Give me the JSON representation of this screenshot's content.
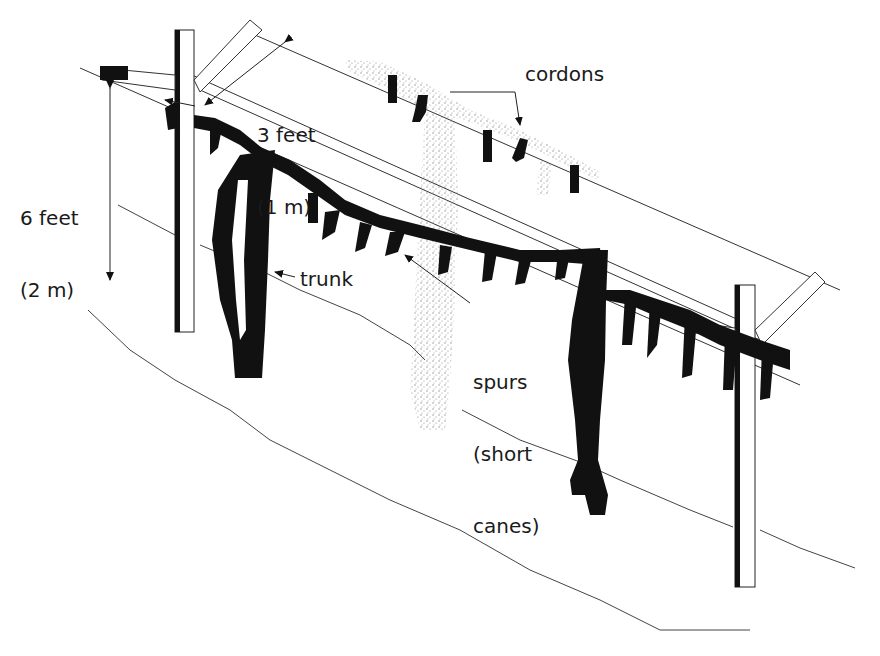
{
  "diagram": {
    "type": "illustration",
    "colors": {
      "ink": "#111111",
      "line": "#333333",
      "stipple": "#9a9a9a",
      "background": "#ffffff"
    },
    "labels": {
      "height_line1": "6 feet",
      "height_line2": "(2 m)",
      "width_line1": "3 feet",
      "width_line2": "(1 m)",
      "cordons": "cordons",
      "trunk": "trunk",
      "spurs_line1": "spurs",
      "spurs_line2": "(short",
      "spurs_line3": "canes)"
    },
    "dimensions": [
      {
        "name": "trellis-height",
        "value": "6 feet",
        "metric": "2 m"
      },
      {
        "name": "cross-arm-width",
        "value": "3 feet",
        "metric": "1 m"
      }
    ],
    "components": [
      "post-left",
      "post-right",
      "cross-arm-left",
      "cross-arm-right",
      "upper-wire",
      "lower-wire",
      "cordon-front",
      "cordon-back",
      "trunk-front",
      "trunk-back",
      "spurs",
      "ground-lines"
    ]
  }
}
